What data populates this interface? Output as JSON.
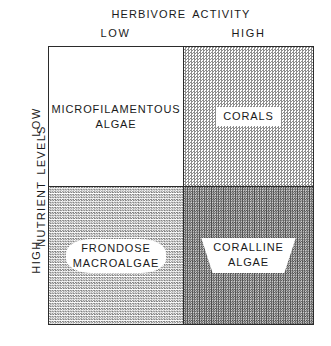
{
  "chart_data": {
    "type": "table",
    "title": "",
    "xlabel": "HERBIVORE ACTIVITY",
    "ylabel": "NUTRIENT LEVELS",
    "x_categories": [
      "LOW",
      "HIGH"
    ],
    "y_categories": [
      "LOW",
      "HIGH"
    ],
    "grid": true,
    "legend": "none",
    "cells": [
      {
        "row": "LOW",
        "col": "LOW",
        "label": "MICROFILAMENTOUS\nALGAE",
        "shading": "none",
        "shading_level": 0
      },
      {
        "row": "LOW",
        "col": "HIGH",
        "label": "CORALS",
        "shading": "light-dither",
        "shading_level": 25
      },
      {
        "row": "HIGH",
        "col": "LOW",
        "label": "FRONDOSE\nMACROALGAE",
        "shading": "light-dither",
        "shading_level": 30
      },
      {
        "row": "HIGH",
        "col": "HIGH",
        "label": "CORALLINE\nALGAE",
        "shading": "dark-dither",
        "shading_level": 55
      }
    ]
  },
  "axes": {
    "x": {
      "title_word_1": "HERBIVORE",
      "title_word_2": "ACTIVITY",
      "tick_low": "LOW",
      "tick_high": "HIGH"
    },
    "y": {
      "title_word_1": "NUTRIENT",
      "title_word_2": "LEVELS",
      "tick_low": "LOW",
      "tick_high": "HIGH"
    }
  },
  "quadrants": {
    "top_left": "MICROFILAMENTOUS\nALGAE",
    "top_right": "CORALS",
    "bottom_left": "FRONDOSE\nMACROALGAE",
    "bottom_right": "CORALLINE\nALGAE"
  },
  "colors": {
    "background": "#ffffff",
    "ink": "#1a1a1a",
    "border": "#2b2b2b",
    "shade_light": "#8d8d8d",
    "shade_dark": "#4a4a4a"
  }
}
